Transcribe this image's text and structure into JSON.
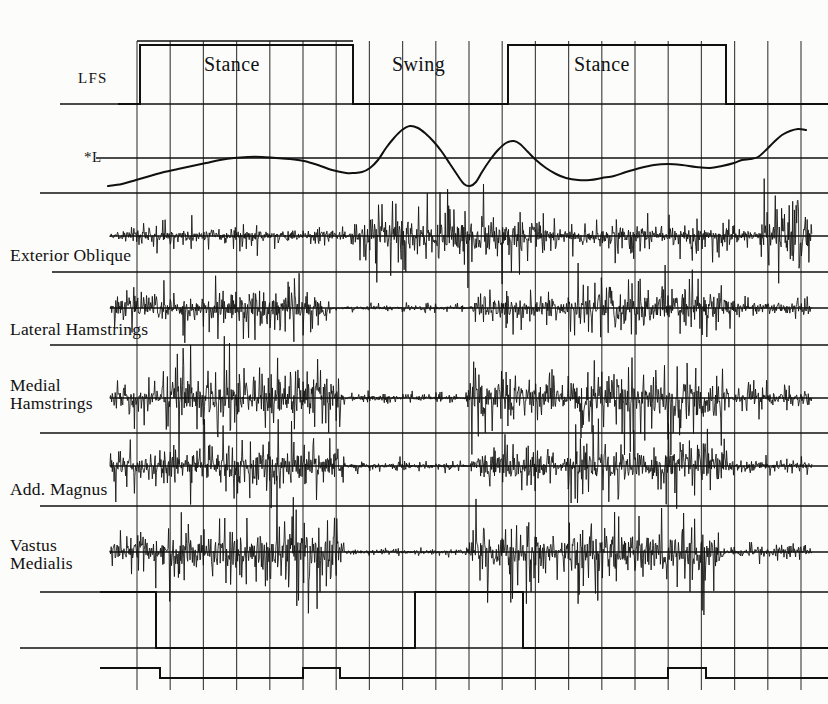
{
  "figure": {
    "type": "multi-channel-timeseries",
    "width": 828,
    "height": 704,
    "background_color": "#fcfcfa",
    "ink_color": "#101010",
    "grid_color": "#3a3a3a"
  },
  "axis_labels": {
    "footswitch": "LFS",
    "kinematic": "*L"
  },
  "phases": [
    {
      "label": "Stance",
      "x_center": 245,
      "y": 68
    },
    {
      "label": "Swing",
      "x_center": 430,
      "y": 68
    },
    {
      "label": "Stance",
      "x_center": 615,
      "y": 68
    }
  ],
  "channels": [
    {
      "name": "Exterior Oblique",
      "label": "Exterior Oblique",
      "label_x": 10,
      "label_y": 248,
      "lines": 1
    },
    {
      "name": "Lateral Hamstrings",
      "label": "Lateral Hamstrings",
      "label_x": 10,
      "label_y": 323,
      "lines": 1
    },
    {
      "name": "Medial Hamstrings",
      "label": "Medial\nHamstrings",
      "label_x": 10,
      "label_y": 378,
      "lines": 2
    },
    {
      "name": "Add. Magnus",
      "label": "Add. Magnus",
      "label_x": 10,
      "label_y": 482,
      "lines": 1
    },
    {
      "name": "Vastus Medialis",
      "label": "Vastus\nMedialis",
      "label_x": 10,
      "label_y": 538,
      "lines": 2
    }
  ],
  "chart_data": {
    "type": "line",
    "xlabel": "",
    "ylabel": "",
    "grid": true,
    "legend": "none",
    "grid_geometry": {
      "x_start": 137,
      "x_end": 794,
      "x_spacing": 33.2,
      "vertical_line_count": 21,
      "y_top": 41,
      "y_bottom": 690
    },
    "traces": [
      {
        "name": "LFS",
        "label": "LFS",
        "type": "square-wave-footswitch",
        "baseline_y": 104,
        "high_y": 45,
        "transitions": [
          {
            "x": 118,
            "level": "low"
          },
          {
            "x": 140,
            "level": "high"
          },
          {
            "x": 353,
            "level": "low"
          },
          {
            "x": 508,
            "level": "high"
          },
          {
            "x": 726,
            "level": "low"
          },
          {
            "x": 800,
            "level": "low"
          }
        ]
      },
      {
        "name": "*L",
        "label": "*L",
        "type": "kinematic-curve",
        "reference_line_y": 158,
        "points_xy": [
          [
            108,
            186
          ],
          [
            122,
            184
          ],
          [
            136,
            180
          ],
          [
            150,
            176
          ],
          [
            164,
            172
          ],
          [
            178,
            169
          ],
          [
            192,
            166
          ],
          [
            206,
            163
          ],
          [
            220,
            160
          ],
          [
            234,
            158
          ],
          [
            248,
            157
          ],
          [
            262,
            157
          ],
          [
            276,
            158
          ],
          [
            290,
            159
          ],
          [
            304,
            161
          ],
          [
            318,
            165
          ],
          [
            332,
            170
          ],
          [
            346,
            173
          ],
          [
            354,
            173
          ],
          [
            362,
            172
          ],
          [
            370,
            168
          ],
          [
            378,
            160
          ],
          [
            386,
            148
          ],
          [
            394,
            138
          ],
          [
            402,
            130
          ],
          [
            410,
            126
          ],
          [
            418,
            128
          ],
          [
            426,
            134
          ],
          [
            434,
            142
          ],
          [
            442,
            152
          ],
          [
            450,
            164
          ],
          [
            458,
            176
          ],
          [
            464,
            184
          ],
          [
            470,
            186
          ],
          [
            476,
            182
          ],
          [
            482,
            172
          ],
          [
            490,
            160
          ],
          [
            498,
            150
          ],
          [
            506,
            143
          ],
          [
            514,
            141
          ],
          [
            520,
            144
          ],
          [
            528,
            152
          ],
          [
            536,
            160
          ],
          [
            546,
            168
          ],
          [
            556,
            174
          ],
          [
            566,
            178
          ],
          [
            578,
            180
          ],
          [
            590,
            180
          ],
          [
            602,
            178
          ],
          [
            614,
            176
          ],
          [
            626,
            172
          ],
          [
            640,
            168
          ],
          [
            654,
            165
          ],
          [
            668,
            164
          ],
          [
            682,
            165
          ],
          [
            696,
            167
          ],
          [
            710,
            168
          ],
          [
            722,
            166
          ],
          [
            734,
            163
          ],
          [
            742,
            160
          ],
          [
            750,
            159
          ],
          [
            758,
            157
          ],
          [
            766,
            150
          ],
          [
            774,
            142
          ],
          [
            782,
            135
          ],
          [
            790,
            131
          ],
          [
            798,
            129
          ],
          [
            806,
            130
          ]
        ]
      },
      {
        "name": "Exterior Oblique",
        "type": "emg-burst",
        "baseline_y": 236,
        "max_amplitude": 34,
        "bursts": [
          {
            "start": 110,
            "end": 350,
            "amplitude": 0.3
          },
          {
            "start": 350,
            "end": 560,
            "amplitude": 0.95
          },
          {
            "start": 560,
            "end": 760,
            "amplitude": 0.42
          },
          {
            "start": 760,
            "end": 812,
            "amplitude": 1.0
          }
        ]
      },
      {
        "name": "Lateral Hamstrings",
        "type": "emg-burst",
        "baseline_y": 308,
        "max_amplitude": 30,
        "bursts": [
          {
            "start": 110,
            "end": 200,
            "amplitude": 0.6
          },
          {
            "start": 200,
            "end": 330,
            "amplitude": 0.8
          },
          {
            "start": 330,
            "end": 470,
            "amplitude": 0.1
          },
          {
            "start": 470,
            "end": 560,
            "amplitude": 0.55
          },
          {
            "start": 560,
            "end": 740,
            "amplitude": 0.95
          },
          {
            "start": 740,
            "end": 812,
            "amplitude": 0.35
          }
        ]
      },
      {
        "name": "Medial Hamstrings",
        "type": "emg-burst",
        "baseline_y": 398,
        "max_amplitude": 36,
        "bursts": [
          {
            "start": 110,
            "end": 160,
            "amplitude": 0.45
          },
          {
            "start": 160,
            "end": 250,
            "amplitude": 0.95
          },
          {
            "start": 250,
            "end": 345,
            "amplitude": 0.9
          },
          {
            "start": 345,
            "end": 465,
            "amplitude": 0.14
          },
          {
            "start": 465,
            "end": 560,
            "amplitude": 0.85
          },
          {
            "start": 560,
            "end": 730,
            "amplitude": 1.0
          },
          {
            "start": 730,
            "end": 812,
            "amplitude": 0.3
          }
        ]
      },
      {
        "name": "Add. Magnus",
        "type": "emg-burst",
        "baseline_y": 466,
        "max_amplitude": 32,
        "bursts": [
          {
            "start": 110,
            "end": 180,
            "amplitude": 0.7
          },
          {
            "start": 180,
            "end": 345,
            "amplitude": 0.85
          },
          {
            "start": 345,
            "end": 470,
            "amplitude": 0.15
          },
          {
            "start": 470,
            "end": 560,
            "amplitude": 0.75
          },
          {
            "start": 560,
            "end": 735,
            "amplitude": 0.95
          },
          {
            "start": 735,
            "end": 812,
            "amplitude": 0.22
          }
        ]
      },
      {
        "name": "Vastus Medialis",
        "type": "emg-burst",
        "baseline_y": 552,
        "max_amplitude": 38,
        "bursts": [
          {
            "start": 110,
            "end": 160,
            "amplitude": 0.5
          },
          {
            "start": 160,
            "end": 345,
            "amplitude": 1.0
          },
          {
            "start": 345,
            "end": 465,
            "amplitude": 0.1
          },
          {
            "start": 465,
            "end": 560,
            "amplitude": 0.8
          },
          {
            "start": 560,
            "end": 725,
            "amplitude": 1.0
          },
          {
            "start": 725,
            "end": 812,
            "amplitude": 0.18
          }
        ]
      },
      {
        "name": "bottom-footswitch-upper",
        "type": "square-wave-footswitch",
        "baseline_y": 648,
        "high_y": 592,
        "transitions": [
          {
            "x": 100,
            "level": "high"
          },
          {
            "x": 156,
            "level": "low"
          },
          {
            "x": 415,
            "level": "high"
          },
          {
            "x": 523,
            "level": "low"
          },
          {
            "x": 812,
            "level": "low"
          }
        ]
      },
      {
        "name": "bottom-footswitch-lower",
        "type": "square-wave-footswitch",
        "baseline_y": 678,
        "high_y": 668,
        "transitions": [
          {
            "x": 100,
            "level": "high"
          },
          {
            "x": 160,
            "level": "low"
          },
          {
            "x": 303,
            "level": "mid"
          },
          {
            "x": 340,
            "level": "low"
          },
          {
            "x": 523,
            "level": "low"
          },
          {
            "x": 668,
            "level": "mid"
          },
          {
            "x": 706,
            "level": "low"
          },
          {
            "x": 812,
            "level": "low"
          }
        ]
      }
    ],
    "separator_rules": [
      {
        "name": "rule-top-axis",
        "x1": 60,
        "x2": 828,
        "y": 104
      },
      {
        "name": "rule-kinematic-base",
        "x1": 40,
        "x2": 828,
        "y": 193
      },
      {
        "name": "rule-exterior-oblique",
        "x1": 52,
        "x2": 828,
        "y": 272
      },
      {
        "name": "rule-lateral-hams",
        "x1": 50,
        "x2": 828,
        "y": 345
      },
      {
        "name": "rule-medial-hams",
        "x1": 40,
        "x2": 828,
        "y": 433
      },
      {
        "name": "rule-add-magnus",
        "x1": 40,
        "x2": 828,
        "y": 506
      },
      {
        "name": "rule-vastus-med",
        "x1": 40,
        "x2": 828,
        "y": 592
      },
      {
        "name": "rule-bottom-base",
        "x1": 20,
        "x2": 828,
        "y": 648
      }
    ]
  }
}
